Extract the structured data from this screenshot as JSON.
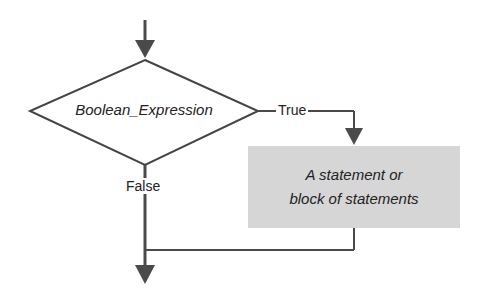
{
  "diagram": {
    "type": "flowchart",
    "decision": {
      "label": "Boolean_Expression"
    },
    "branches": {
      "true_label": "True",
      "false_label": "False"
    },
    "process": {
      "line1": "A statement or",
      "line2": "block of statements"
    },
    "colors": {
      "line": "#4a4a4a",
      "process_fill": "#d6d6d6",
      "text": "#222222"
    }
  }
}
